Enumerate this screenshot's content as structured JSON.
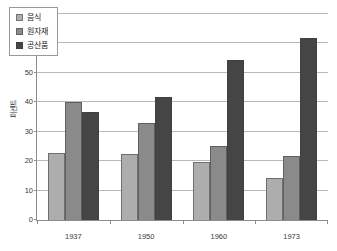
{
  "chart_data": {
    "type": "bar",
    "title": "",
    "subtitle": "",
    "xlabel": "",
    "ylabel": "퍼센트",
    "categories": [
      "1937",
      "1950",
      "1960",
      "1973"
    ],
    "series": [
      {
        "name": "음식",
        "color": "#ADADAD",
        "values": [
          22.7,
          22.3,
          19.7,
          14.4
        ]
      },
      {
        "name": "원자재",
        "color": "#8A8A8A",
        "values": [
          40.0,
          33.0,
          25.0,
          21.8
        ]
      },
      {
        "name": "공산품",
        "color": "#454545",
        "values": [
          36.7,
          41.8,
          54.4,
          62.0
        ]
      }
    ],
    "ylim": [
      0,
      70
    ],
    "yticks": [
      0,
      10,
      20,
      30,
      40,
      50,
      60,
      70
    ],
    "ytick_labels": [
      "0",
      "10",
      "20",
      "30",
      "40",
      "50",
      "60",
      "70"
    ],
    "grid": true,
    "grid_axis": "y",
    "legend_position": "top-left",
    "bar_group_gap": true
  },
  "top_sliver_text": ""
}
